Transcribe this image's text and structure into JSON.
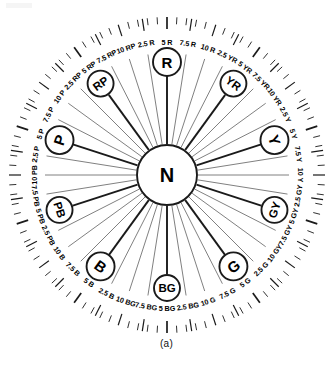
{
  "figure": {
    "caption": "(a)",
    "center_label": "N",
    "geometry": {
      "cx": 167,
      "cy": 175,
      "outer_tick_radius": 158,
      "inner_tick_radius": 146,
      "minor_tick_radius": 151,
      "label_radius": 133,
      "hub_radius": 113,
      "center_radius": 30
    },
    "colors": {
      "line": "#1a1a1a",
      "thin_line": "#555555",
      "background": "#ffffff",
      "text": "#000000"
    }
  },
  "principal_hues": [
    {
      "label": "R",
      "tick": "5 R",
      "angle": 0
    },
    {
      "label": "YR",
      "tick": "5 YR",
      "angle": 36
    },
    {
      "label": "Y",
      "tick": "5 Y",
      "angle": 72
    },
    {
      "label": "GY",
      "tick": "5 GY",
      "angle": 108
    },
    {
      "label": "G",
      "tick": "5 G",
      "angle": 144
    },
    {
      "label": "BG",
      "tick": "5 BG",
      "angle": 180
    },
    {
      "label": "B",
      "tick": "5 B",
      "angle": 216
    },
    {
      "label": "PB",
      "tick": "5 PB",
      "angle": 252
    },
    {
      "label": "P",
      "tick": "5 P",
      "angle": 288
    },
    {
      "label": "RP",
      "tick": "5 RP",
      "angle": 324
    }
  ],
  "hue_labels": [
    {
      "text": "5 R",
      "angle": 0,
      "major": true
    },
    {
      "text": "7.5 R",
      "angle": 9,
      "major": false
    },
    {
      "text": "10 R",
      "angle": 18,
      "major": false
    },
    {
      "text": "2.5 YR",
      "angle": 27,
      "major": false
    },
    {
      "text": "5 YR",
      "angle": 36,
      "major": true
    },
    {
      "text": "7.5 YR",
      "angle": 45,
      "major": false
    },
    {
      "text": "10 YR",
      "angle": 54,
      "major": false
    },
    {
      "text": "2.5 Y",
      "angle": 63,
      "major": false
    },
    {
      "text": "5 Y",
      "angle": 72,
      "major": true
    },
    {
      "text": "7.5 Y",
      "angle": 81,
      "major": false
    },
    {
      "text": "10 Y",
      "angle": 90,
      "major": false
    },
    {
      "text": "2.5 GY",
      "angle": 99,
      "major": false
    },
    {
      "text": "5 GY",
      "angle": 108,
      "major": true
    },
    {
      "text": "7.5 GY",
      "angle": 117,
      "major": false
    },
    {
      "text": "10 GY",
      "angle": 126,
      "major": false
    },
    {
      "text": "2.5 G",
      "angle": 135,
      "major": false
    },
    {
      "text": "5 G",
      "angle": 144,
      "major": true
    },
    {
      "text": "7.5 G",
      "angle": 153,
      "major": false
    },
    {
      "text": "10 G",
      "angle": 162,
      "major": false
    },
    {
      "text": "2.5 BG",
      "angle": 171,
      "major": false
    },
    {
      "text": "5 BG",
      "angle": 180,
      "major": true
    },
    {
      "text": "7.5 BG",
      "angle": 189,
      "major": false
    },
    {
      "text": "10 BG",
      "angle": 198,
      "major": false
    },
    {
      "text": "2.5 B",
      "angle": 207,
      "major": false
    },
    {
      "text": "5 B",
      "angle": 216,
      "major": true
    },
    {
      "text": "7.5 B",
      "angle": 225,
      "major": false
    },
    {
      "text": "10 B",
      "angle": 234,
      "major": false
    },
    {
      "text": "2.5 PB",
      "angle": 243,
      "major": false
    },
    {
      "text": "5 PB",
      "angle": 252,
      "major": true
    },
    {
      "text": "7.5 PB",
      "angle": 261,
      "major": false
    },
    {
      "text": "10 PB",
      "angle": 270,
      "major": false
    },
    {
      "text": "2.5 P",
      "angle": 279,
      "major": false
    },
    {
      "text": "5 P",
      "angle": 288,
      "major": true
    },
    {
      "text": "7.5 P",
      "angle": 297,
      "major": false
    },
    {
      "text": "10 P",
      "angle": 306,
      "major": false
    },
    {
      "text": "2.5 RP",
      "angle": 315,
      "major": false
    },
    {
      "text": "5 RP",
      "angle": 324,
      "major": true
    },
    {
      "text": "7.5 RP",
      "angle": 333,
      "major": false
    },
    {
      "text": "10 RP",
      "angle": 342,
      "major": false
    },
    {
      "text": "2.5 R",
      "angle": 351,
      "major": false
    }
  ]
}
